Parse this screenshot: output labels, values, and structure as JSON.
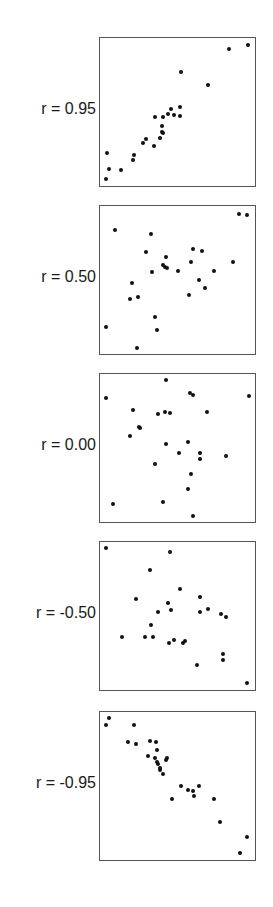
{
  "chart_data": [
    {
      "type": "scatter",
      "label": "r = 0.95",
      "r": 0.95,
      "grid": false,
      "axes_ticks": false,
      "points": [
        [
          0.961,
          0.953
        ],
        [
          0.84,
          0.927
        ],
        [
          0.528,
          0.769
        ],
        [
          0.701,
          0.68
        ],
        [
          0.519,
          0.531
        ],
        [
          0.459,
          0.518
        ],
        [
          0.519,
          0.469
        ],
        [
          0.483,
          0.473
        ],
        [
          0.442,
          0.48
        ],
        [
          0.408,
          0.46
        ],
        [
          0.355,
          0.462
        ],
        [
          0.4,
          0.404
        ],
        [
          0.404,
          0.36
        ],
        [
          0.41,
          0.356
        ],
        [
          0.389,
          0.318
        ],
        [
          0.301,
          0.316
        ],
        [
          0.28,
          0.284
        ],
        [
          0.348,
          0.262
        ],
        [
          0.047,
          0.218
        ],
        [
          0.222,
          0.207
        ],
        [
          0.212,
          0.167
        ],
        [
          0.056,
          0.111
        ],
        [
          0.137,
          0.104
        ],
        [
          0.038,
          0.04
        ]
      ]
    },
    {
      "type": "scatter",
      "label": "r = 0.50",
      "r": 0.5,
      "grid": false,
      "axes_ticks": false,
      "points": [
        [
          0.904,
          0.944
        ],
        [
          0.957,
          0.938
        ],
        [
          0.1,
          0.838
        ],
        [
          0.328,
          0.811
        ],
        [
          0.296,
          0.689
        ],
        [
          0.43,
          0.651
        ],
        [
          0.606,
          0.709
        ],
        [
          0.664,
          0.691
        ],
        [
          0.594,
          0.622
        ],
        [
          0.408,
          0.6
        ],
        [
          0.424,
          0.587
        ],
        [
          0.436,
          0.58
        ],
        [
          0.509,
          0.56
        ],
        [
          0.34,
          0.551
        ],
        [
          0.74,
          0.56
        ],
        [
          0.866,
          0.618
        ],
        [
          0.643,
          0.5
        ],
        [
          0.679,
          0.443
        ],
        [
          0.209,
          0.478
        ],
        [
          0.579,
          0.396
        ],
        [
          0.196,
          0.364
        ],
        [
          0.245,
          0.38
        ],
        [
          0.359,
          0.244
        ],
        [
          0.036,
          0.178
        ],
        [
          0.368,
          0.156
        ],
        [
          0.24,
          0.033
        ]
      ]
    },
    {
      "type": "scatter",
      "label": "r = 0.00",
      "r": 0.0,
      "grid": false,
      "axes_ticks": false,
      "points": [
        [
          0.43,
          0.962
        ],
        [
          0.587,
          0.871
        ],
        [
          0.604,
          0.857
        ],
        [
          0.039,
          0.839
        ],
        [
          0.968,
          0.852
        ],
        [
          0.217,
          0.752
        ],
        [
          0.424,
          0.743
        ],
        [
          0.454,
          0.735
        ],
        [
          0.378,
          0.725
        ],
        [
          0.695,
          0.743
        ],
        [
          0.252,
          0.641
        ],
        [
          0.262,
          0.633
        ],
        [
          0.194,
          0.581
        ],
        [
          0.426,
          0.526
        ],
        [
          0.572,
          0.539
        ],
        [
          0.514,
          0.465
        ],
        [
          0.647,
          0.463
        ],
        [
          0.649,
          0.423
        ],
        [
          0.819,
          0.441
        ],
        [
          0.355,
          0.389
        ],
        [
          0.591,
          0.322
        ],
        [
          0.574,
          0.215
        ],
        [
          0.084,
          0.114
        ],
        [
          0.406,
          0.132
        ],
        [
          0.604,
          0.031
        ]
      ]
    },
    {
      "type": "scatter",
      "label": "r = -0.50",
      "r": -0.5,
      "grid": false,
      "axes_ticks": false,
      "points": [
        [
          0.038,
          0.962
        ],
        [
          0.455,
          0.931
        ],
        [
          0.323,
          0.808
        ],
        [
          0.52,
          0.677
        ],
        [
          0.651,
          0.624
        ],
        [
          0.236,
          0.611
        ],
        [
          0.44,
          0.587
        ],
        [
          0.462,
          0.54
        ],
        [
          0.699,
          0.542
        ],
        [
          0.375,
          0.524
        ],
        [
          0.647,
          0.524
        ],
        [
          0.787,
          0.511
        ],
        [
          0.821,
          0.487
        ],
        [
          0.332,
          0.438
        ],
        [
          0.145,
          0.354
        ],
        [
          0.289,
          0.354
        ],
        [
          0.347,
          0.354
        ],
        [
          0.483,
          0.334
        ],
        [
          0.449,
          0.316
        ],
        [
          0.538,
          0.316
        ],
        [
          0.551,
          0.325
        ],
        [
          0.798,
          0.239
        ],
        [
          0.798,
          0.195
        ],
        [
          0.63,
          0.164
        ],
        [
          0.953,
          0.038
        ]
      ]
    },
    {
      "type": "scatter",
      "label": "r = -0.95",
      "r": -0.95,
      "grid": false,
      "axes_ticks": false,
      "points": [
        [
          0.06,
          0.962
        ],
        [
          0.038,
          0.909
        ],
        [
          0.222,
          0.909
        ],
        [
          0.184,
          0.796
        ],
        [
          0.235,
          0.783
        ],
        [
          0.325,
          0.801
        ],
        [
          0.361,
          0.796
        ],
        [
          0.372,
          0.741
        ],
        [
          0.31,
          0.7
        ],
        [
          0.359,
          0.69
        ],
        [
          0.432,
          0.69
        ],
        [
          0.372,
          0.663
        ],
        [
          0.378,
          0.643
        ],
        [
          0.389,
          0.62
        ],
        [
          0.389,
          0.607
        ],
        [
          0.408,
          0.58
        ],
        [
          0.427,
          0.672
        ],
        [
          0.526,
          0.5
        ],
        [
          0.571,
          0.467
        ],
        [
          0.607,
          0.462
        ],
        [
          0.641,
          0.5
        ],
        [
          0.61,
          0.427
        ],
        [
          0.466,
          0.409
        ],
        [
          0.741,
          0.409
        ],
        [
          0.778,
          0.254
        ],
        [
          0.953,
          0.15
        ],
        [
          0.908,
          0.04
        ]
      ]
    }
  ]
}
